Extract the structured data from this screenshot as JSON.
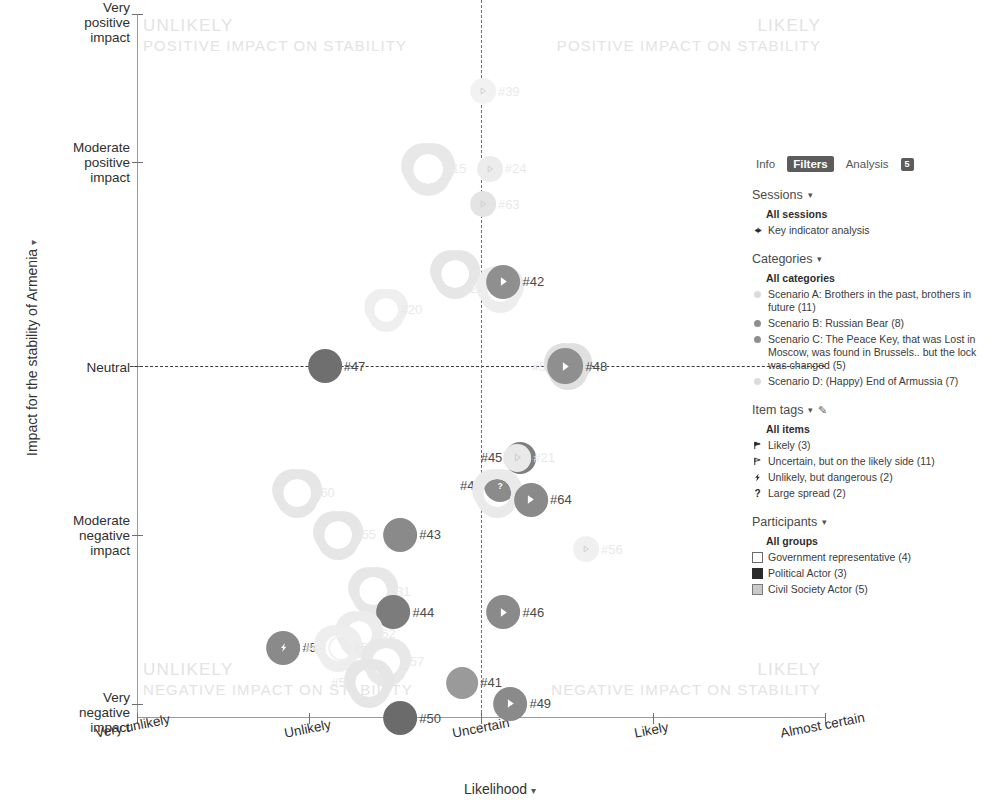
{
  "axes": {
    "y_title": "Impact for the stability of Armenia",
    "x_title": "Likelihood",
    "y_ticks": [
      "Very positive\nimpact",
      "Moderate\npositive\nimpact",
      "Neutral",
      "Moderate\nnegative\nimpact",
      "Very negative\nimpact"
    ],
    "x_ticks": [
      "Very unlikely",
      "Unlikely",
      "Uncertain",
      "Likely",
      "Almost certain"
    ]
  },
  "quadrants": [
    {
      "title": "UNLIKELY",
      "subtitle": "POSITIVE IMPACT ON STABILITY"
    },
    {
      "title": "LIKELY",
      "subtitle": "POSITIVE IMPACT ON STABILITY"
    },
    {
      "title": "UNLIKELY",
      "subtitle": "NEGATIVE IMPACT ON STABILITY"
    },
    {
      "title": "LIKELY",
      "subtitle": "NEGATIVE IMPACT ON STABILITY"
    }
  ],
  "panel": {
    "tabs": [
      {
        "label": "Info",
        "active": false
      },
      {
        "label": "Filters",
        "active": true
      },
      {
        "label": "Analysis",
        "active": false
      }
    ],
    "tab_badge": "5",
    "sessions": {
      "title": "Sessions",
      "all_label": "All sessions",
      "items": [
        {
          "label": "Key indicator analysis",
          "icon": "pin-icon"
        }
      ]
    },
    "categories": {
      "title": "Categories",
      "all_label": "All categories",
      "items": [
        {
          "label": "Scenario A: Brothers in the past, brothers in future (11)",
          "marker": "pale"
        },
        {
          "label": "Scenario B: Russian Bear (8)",
          "marker": "solid"
        },
        {
          "label": "Scenario C: The Peace Key, that was Lost in Moscow, was found in Brussels.. but the lock was changed (5)",
          "marker": "solid"
        },
        {
          "label": "Scenario D: (Happy) End of Armussia (7)",
          "marker": "pale"
        }
      ]
    },
    "item_tags": {
      "title": "Item tags",
      "all_label": "All items",
      "items": [
        {
          "label": "Likely (3)",
          "icon": "flag-filled-icon"
        },
        {
          "label": "Uncertain, but on the likely side (11)",
          "icon": "flag-outline-icon"
        },
        {
          "label": "Unlikely, but dangerous (2)",
          "icon": "bolt-icon"
        },
        {
          "label": "Large spread (2)",
          "icon": "question-icon"
        }
      ]
    },
    "participants": {
      "title": "Participants",
      "all_label": "All groups",
      "items": [
        {
          "label": "Government representative (4)",
          "swatch": "empty"
        },
        {
          "label": "Political Actor (3)",
          "swatch": "filled"
        },
        {
          "label": "Civil Society Actor (5)",
          "swatch": "hatch"
        }
      ]
    }
  },
  "chart_data": {
    "type": "scatter",
    "title": "",
    "xlabel": "Likelihood",
    "ylabel": "Impact for the stability of Armenia",
    "xlim": [
      0,
      100
    ],
    "ylim": [
      0,
      100
    ],
    "grid": false,
    "x_tick_values": [
      0,
      25,
      50,
      75,
      100
    ],
    "x_tick_labels": [
      "Very unlikely",
      "Unlikely",
      "Uncertain",
      "Likely",
      "Almost certain"
    ],
    "y_tick_values": [
      100,
      79,
      50,
      26,
      2
    ],
    "y_tick_labels": [
      "Very positive impact",
      "Moderate positive impact",
      "Neutral",
      "Moderate negative impact",
      "Very negative impact"
    ],
    "reference_lines": {
      "vertical_x": 50,
      "horizontal_y": 50
    },
    "points": [
      {
        "label": "#39",
        "x": 52,
        "y": 89,
        "size": 13,
        "icon": "flag-outline-icon",
        "color": "#f2f2f2",
        "faded": true,
        "label_side": "right"
      },
      {
        "label": "#15",
        "x": 44,
        "y": 78,
        "size": 15,
        "icon": "cluster-icon",
        "color": "#e8e8e8",
        "faded": true,
        "label_side": "right"
      },
      {
        "label": "#24",
        "x": 53,
        "y": 78,
        "size": 13,
        "icon": "flag-outline-icon",
        "color": "#ececec",
        "faded": true,
        "label_side": "right"
      },
      {
        "label": "#63",
        "x": 52,
        "y": 73,
        "size": 13,
        "icon": "flag-outline-icon",
        "color": "#e4e4e4",
        "faded": true,
        "label_side": "right"
      },
      {
        "label": "#23",
        "x": 48,
        "y": 63,
        "size": 14,
        "icon": "cluster-icon",
        "color": "#e6e6e6",
        "faded": true,
        "label_side": "right"
      },
      {
        "label": "#22",
        "x": 51,
        "y": 61,
        "size": 13,
        "icon": "cluster-icon",
        "color": "#ededed",
        "faded": true,
        "label_side": "left"
      },
      {
        "label": "#42",
        "x": 55,
        "y": 62,
        "size": 17,
        "icon": "flag-filled-icon",
        "color": "#8f8f8f",
        "faded": false,
        "label_side": "right"
      },
      {
        "label": "#20",
        "x": 38,
        "y": 58,
        "size": 12,
        "icon": "cluster-icon",
        "color": "#efefef",
        "faded": true,
        "label_side": "right"
      },
      {
        "label": "#47",
        "x": 29,
        "y": 50,
        "size": 17,
        "icon": "plain-icon",
        "color": "#6f6f6f",
        "faded": false,
        "label_side": "right"
      },
      {
        "label": "#58",
        "x": 61,
        "y": 50,
        "size": 13,
        "icon": "cluster-icon",
        "color": "#e0e0e0",
        "faded": true,
        "label_side": "left"
      },
      {
        "label": "#48",
        "x": 64,
        "y": 50,
        "size": 18,
        "icon": "flag-filled-icon",
        "color": "#8f8f8f",
        "faded": false,
        "label_side": "right"
      },
      {
        "label": "#45",
        "x": 54,
        "y": 37,
        "size": 16,
        "icon": "flag-filled-icon",
        "color": "#7e7e7e",
        "faded": false,
        "label_side": "left"
      },
      {
        "label": "#21",
        "x": 57,
        "y": 37,
        "size": 14,
        "icon": "flag-outline-icon",
        "color": "#e9e9e9",
        "faded": true,
        "label_side": "right"
      },
      {
        "label": "#40",
        "x": 51,
        "y": 33,
        "size": 16,
        "icon": "question-icon",
        "color": "#8b8b8b",
        "faded": false,
        "label_side": "left"
      },
      {
        "label": "#25",
        "x": 54,
        "y": 32,
        "size": 14,
        "icon": "cluster-icon",
        "color": "#eaeaea",
        "faded": true,
        "label_side": "right"
      },
      {
        "label": "#64",
        "x": 59,
        "y": 31,
        "size": 17,
        "icon": "flag-filled-icon",
        "color": "#8a8a8a",
        "faded": false,
        "label_side": "right"
      },
      {
        "label": "#60",
        "x": 25,
        "y": 32,
        "size": 14,
        "icon": "cluster-icon",
        "color": "#e6e6e6",
        "faded": true,
        "label_side": "right"
      },
      {
        "label": "#55",
        "x": 31,
        "y": 26,
        "size": 14,
        "icon": "cluster-icon",
        "color": "#e6e6e6",
        "faded": true,
        "label_side": "right"
      },
      {
        "label": "#43",
        "x": 40,
        "y": 26,
        "size": 17,
        "icon": "plain-icon",
        "color": "#8a8a8a",
        "faded": false,
        "label_side": "right"
      },
      {
        "label": "#56",
        "x": 67,
        "y": 24,
        "size": 13,
        "icon": "flag-outline-icon",
        "color": "#f0f0f0",
        "faded": true,
        "label_side": "right"
      },
      {
        "label": "#31",
        "x": 36,
        "y": 18,
        "size": 14,
        "icon": "cluster-icon",
        "color": "#e7e7e7",
        "faded": true,
        "label_side": "right"
      },
      {
        "label": "#44",
        "x": 39,
        "y": 15,
        "size": 17,
        "icon": "plain-icon",
        "color": "#7c7c7c",
        "faded": false,
        "label_side": "right"
      },
      {
        "label": "#46",
        "x": 55,
        "y": 15,
        "size": 17,
        "icon": "flag-filled-icon",
        "color": "#8a8a8a",
        "faded": false,
        "label_side": "right"
      },
      {
        "label": "#62",
        "x": 34,
        "y": 12,
        "size": 13,
        "icon": "cluster-icon",
        "color": "#ececec",
        "faded": true,
        "label_side": "right"
      },
      {
        "label": "#52",
        "x": 23,
        "y": 10,
        "size": 17,
        "icon": "bolt-icon",
        "color": "#8a8a8a",
        "faded": false,
        "label_side": "right"
      },
      {
        "label": "#02",
        "x": 28,
        "y": 10,
        "size": 13,
        "icon": "ring-icon",
        "color": "#f1f1f1",
        "faded": true,
        "label_side": "left"
      },
      {
        "label": "#53",
        "x": 31,
        "y": 10,
        "size": 13,
        "icon": "cluster-icon",
        "color": "#eeeeee",
        "faded": true,
        "label_side": "right"
      },
      {
        "label": "#57",
        "x": 38,
        "y": 8,
        "size": 14,
        "icon": "cluster-icon",
        "color": "#e8e8e8",
        "faded": true,
        "label_side": "right"
      },
      {
        "label": "#54",
        "x": 32,
        "y": 5,
        "size": 14,
        "icon": "cluster-icon",
        "color": "#e6e6e6",
        "faded": true,
        "label_side": "left"
      },
      {
        "label": "#41",
        "x": 49,
        "y": 5,
        "size": 16,
        "icon": "plain-icon",
        "color": "#9a9a9a",
        "faded": false,
        "label_side": "right"
      },
      {
        "label": "#49",
        "x": 56,
        "y": 2,
        "size": 17,
        "icon": "flag-filled-icon",
        "color": "#8a8a8a",
        "faded": false,
        "label_side": "right"
      },
      {
        "label": "#50",
        "x": 40,
        "y": 0,
        "size": 17,
        "icon": "plain-icon",
        "color": "#6b6b6b",
        "faded": false,
        "label_side": "right"
      }
    ]
  }
}
